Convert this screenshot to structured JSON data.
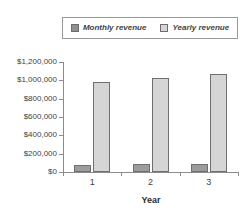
{
  "legend": {
    "position": "top",
    "entries": [
      {
        "label": "Monthly revenue",
        "color": "#8f8f8f",
        "icon": "legend-swatch-icon"
      },
      {
        "label": "Yearly revenue",
        "color": "#d5d5d5",
        "icon": "legend-swatch-icon"
      }
    ]
  },
  "axis": {
    "y_ticks": [
      "$1,200,000",
      "$1,000,000",
      "$800,000",
      "$600,000",
      "$400,000",
      "$200,000",
      "$0"
    ],
    "x_ticks": [
      "1",
      "2",
      "3"
    ],
    "x_title": "Year"
  },
  "chart_data": {
    "type": "bar",
    "title": "",
    "xlabel": "Year",
    "ylabel": "",
    "categories": [
      "1",
      "2",
      "3"
    ],
    "series": [
      {
        "name": "Monthly revenue",
        "values": [
          80000,
          82000,
          88000
        ],
        "color": "#9c9c9c"
      },
      {
        "name": "Yearly revenue",
        "values": [
          980000,
          1025000,
          1070000
        ],
        "color": "#d5d5d5"
      }
    ],
    "ylim": [
      0,
      1200000
    ],
    "ytick_values": [
      1200000,
      1000000,
      800000,
      600000,
      400000,
      200000,
      0
    ],
    "ytick_labels": [
      "$1,200,000",
      "$1,000,000",
      "$800,000",
      "$600,000",
      "$400,000",
      "$200,000",
      "$0"
    ],
    "grid": false,
    "legend_position": "top"
  }
}
